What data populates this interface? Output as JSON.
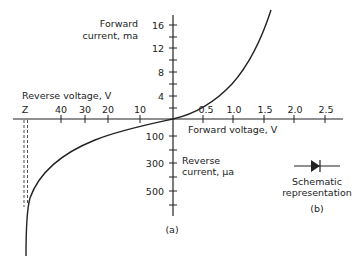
{
  "figure": {
    "panel_a_label": "(a)",
    "panel_b_label": "(b)",
    "forward_current_axis": {
      "label_line1": "Forward",
      "label_line2": "current, ma",
      "ticks": [
        "16",
        "12",
        "8",
        "4"
      ]
    },
    "reverse_current_axis": {
      "label_line1": "Reverse",
      "label_line2": "current, μa",
      "ticks": [
        "100",
        "300",
        "500"
      ]
    },
    "reverse_voltage_axis": {
      "label": "Reverse voltage, V",
      "ticks": [
        "Z",
        "40",
        "30",
        "20",
        "10"
      ]
    },
    "forward_voltage_axis": {
      "label": "Forward voltage, V",
      "ticks": [
        "0.5",
        "1.0",
        "1.5",
        "2.0",
        "2.5"
      ]
    },
    "schematic": {
      "label_line1": "Schematic",
      "label_line2": "representation",
      "icon": "diode-symbol"
    },
    "colors": {
      "ink": "#222222",
      "background": "#ffffff"
    }
  }
}
